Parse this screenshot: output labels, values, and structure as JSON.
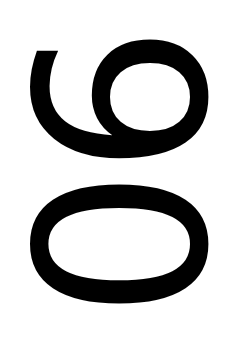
{
  "text": "90",
  "rotation_deg": 90,
  "colors": {
    "foreground": "#000000",
    "background": "#ffffff"
  }
}
